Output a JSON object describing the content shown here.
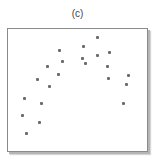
{
  "chart_data": {
    "type": "scatter",
    "title": "(c)",
    "xlabel": "",
    "ylabel": "",
    "axes_ticks": false,
    "grid": false,
    "legend": null,
    "frame_px": {
      "left": 8,
      "top": 29,
      "right": 147,
      "bottom": 151
    },
    "point_color": "#6b6b6b",
    "points_px": [
      {
        "x": 24,
        "y": 98
      },
      {
        "x": 41,
        "y": 103
      },
      {
        "x": 22,
        "y": 115
      },
      {
        "x": 39,
        "y": 122
      },
      {
        "x": 26,
        "y": 133
      },
      {
        "x": 59,
        "y": 50
      },
      {
        "x": 62,
        "y": 61
      },
      {
        "x": 47,
        "y": 66
      },
      {
        "x": 58,
        "y": 74
      },
      {
        "x": 37,
        "y": 79
      },
      {
        "x": 49,
        "y": 86
      },
      {
        "x": 97,
        "y": 37
      },
      {
        "x": 83,
        "y": 46
      },
      {
        "x": 109,
        "y": 52
      },
      {
        "x": 97,
        "y": 55
      },
      {
        "x": 82,
        "y": 58
      },
      {
        "x": 85,
        "y": 63
      },
      {
        "x": 107,
        "y": 66
      },
      {
        "x": 108,
        "y": 78
      },
      {
        "x": 128,
        "y": 75
      },
      {
        "x": 126,
        "y": 84
      },
      {
        "x": 123,
        "y": 103
      }
    ],
    "points_normalized": {
      "note": "x,y in 0-100 plot units, y increasing upward",
      "x": [
        11.5,
        23.7,
        10.1,
        22.3,
        12.9,
        36.7,
        38.8,
        28.1,
        36.0,
        20.9,
        29.5,
        64.0,
        54.0,
        72.7,
        64.0,
        53.2,
        55.4,
        71.2,
        71.9,
        86.3,
        84.9,
        82.7
      ],
      "y": [
        43.4,
        39.3,
        29.5,
        23.8,
        14.8,
        82.8,
        73.8,
        69.7,
        63.1,
        59.0,
        53.3,
        93.4,
        86.1,
        81.1,
        78.7,
        76.2,
        72.1,
        69.7,
        59.8,
        62.3,
        54.9,
        39.3
      ]
    }
  }
}
